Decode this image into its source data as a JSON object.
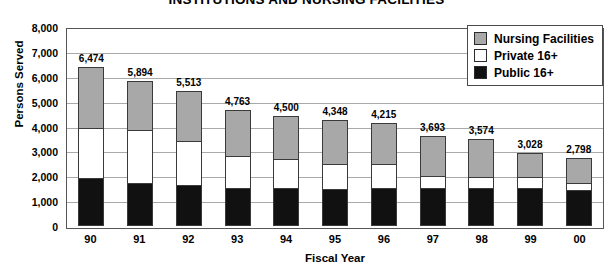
{
  "chart_data": {
    "type": "bar",
    "subtype": "stacked-vertical",
    "title": "INSTITUTIONS AND NURSING FACILITIES",
    "xlabel": "Fiscal Year",
    "ylabel": "Persons Served",
    "ylim": [
      0,
      8000
    ],
    "ytick_step": 1000,
    "grid": true,
    "legend_position": "top-right",
    "categories": [
      "90",
      "91",
      "92",
      "93",
      "94",
      "95",
      "96",
      "97",
      "98",
      "99",
      "00"
    ],
    "ytick_labels": [
      "8,000",
      "7,000",
      "6,000",
      "5,000",
      "4,000",
      "3,000",
      "2,000",
      "1,000",
      "0"
    ],
    "ytick_values": [
      8000,
      7000,
      6000,
      5000,
      4000,
      3000,
      2000,
      1000,
      0
    ],
    "totals": [
      6474,
      5894,
      5513,
      4763,
      4500,
      4348,
      4215,
      3693,
      3574,
      3028,
      2798
    ],
    "total_labels": [
      "6,474",
      "5,894",
      "5,513",
      "4,763",
      "4,500",
      "4,348",
      "4,215",
      "3,693",
      "3,574",
      "3,028",
      "2,798"
    ],
    "series": [
      {
        "name": "Nursing Facilities",
        "color": "#a8a8a8",
        "values": [
          2474,
          2014,
          2073,
          1923,
          1780,
          1828,
          1695,
          1653,
          1574,
          1028,
          1038
        ]
      },
      {
        "name": "Private 16+",
        "color": "#ffffff",
        "values": [
          2080,
          2160,
          1800,
          1320,
          1200,
          1020,
          1000,
          520,
          480,
          480,
          320
        ]
      },
      {
        "name": "Public 16+",
        "color": "#111111",
        "values": [
          1920,
          1720,
          1640,
          1520,
          1520,
          1500,
          1520,
          1520,
          1520,
          1520,
          1440
        ]
      }
    ],
    "legend": [
      {
        "label": "Nursing Facilities",
        "swatch": "#a8a8a8"
      },
      {
        "label": "Private 16+",
        "swatch": "#ffffff"
      },
      {
        "label": "Public 16+",
        "swatch": "#111111"
      }
    ]
  }
}
